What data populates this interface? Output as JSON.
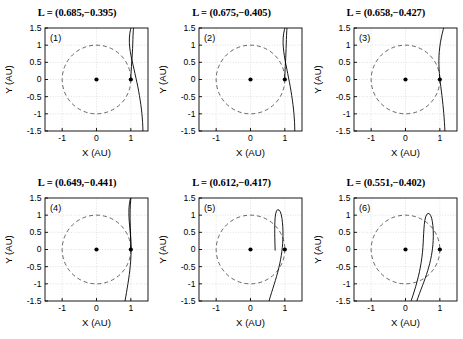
{
  "figure": {
    "rows": 2,
    "cols": 3,
    "background": "#ffffff",
    "curve_color": "#000000",
    "circle_color": "#555555",
    "grid_color": "#cccccc",
    "axis_color": "#000000"
  },
  "axes": {
    "xlabel": "X (AU)",
    "ylabel": "Y (AU)",
    "xticks": [
      "-1",
      "0",
      "1"
    ],
    "xtick_values": [
      -1,
      0,
      1
    ],
    "yticks": [
      "1.5",
      "1",
      "0.5",
      "0",
      "-0.5",
      "-1",
      "-1.5"
    ],
    "ytick_values": [
      1.5,
      1,
      0.5,
      0,
      -0.5,
      -1,
      -1.5
    ],
    "xlim": [
      -1.5,
      1.5
    ],
    "ylim": [
      -1.5,
      1.5
    ],
    "grid": true,
    "grid_style": "dotted"
  },
  "markers": {
    "origin": {
      "x": 0,
      "y": 0,
      "label": "sun-marker"
    },
    "earth": {
      "x": 1,
      "y": 0,
      "label": "earth-marker"
    },
    "unit_circle_radius": 1,
    "unit_circle_style": "dashed"
  },
  "chart_data": {
    "type": "line",
    "xlabel": "X (AU)",
    "ylabel": "Y (AU)",
    "xlim": [
      -1.5,
      1.5
    ],
    "ylim": [
      -1.5,
      1.5
    ],
    "grid": true,
    "legend": "none",
    "panels": [
      {
        "index": "(1)",
        "title": "L = (0.685,−0.395)",
        "L": [
          0.685,
          -0.395
        ],
        "curve": [
          [
            1.352,
            -1.5
          ],
          [
            1.349,
            -1.38
          ],
          [
            1.343,
            -1.25
          ],
          [
            1.334,
            -1.12
          ],
          [
            1.322,
            -0.99
          ],
          [
            1.308,
            -0.86
          ],
          [
            1.291,
            -0.73
          ],
          [
            1.272,
            -0.6
          ],
          [
            1.251,
            -0.47
          ],
          [
            1.228,
            -0.34
          ],
          [
            1.203,
            -0.21
          ],
          [
            1.176,
            -0.08
          ],
          [
            1.15,
            0.04
          ],
          [
            1.121,
            0.17
          ],
          [
            1.092,
            0.3
          ],
          [
            1.062,
            0.43
          ],
          [
            1.033,
            0.56
          ],
          [
            1.006,
            0.69
          ],
          [
            0.983,
            0.82
          ],
          [
            0.966,
            0.95
          ],
          [
            0.957,
            1.08
          ],
          [
            0.958,
            1.21
          ],
          [
            0.97,
            1.34
          ],
          [
            0.992,
            1.46
          ],
          [
            1.002,
            1.5
          ]
        ],
        "curve2": [
          [
            1.0,
            0.0
          ],
          [
            1.004,
            0.12
          ],
          [
            1.01,
            0.25
          ],
          [
            1.018,
            0.38
          ],
          [
            1.027,
            0.51
          ],
          [
            1.036,
            0.64
          ],
          [
            1.044,
            0.77
          ],
          [
            1.051,
            0.9
          ],
          [
            1.056,
            1.03
          ],
          [
            1.06,
            1.16
          ],
          [
            1.065,
            1.29
          ],
          [
            1.072,
            1.42
          ],
          [
            1.078,
            1.5
          ]
        ]
      },
      {
        "index": "(2)",
        "title": "L = (0.675,−0.405)",
        "L": [
          0.675,
          -0.405
        ],
        "curve": [
          [
            1.29,
            -1.5
          ],
          [
            1.288,
            -1.38
          ],
          [
            1.283,
            -1.25
          ],
          [
            1.275,
            -1.12
          ],
          [
            1.265,
            -0.99
          ],
          [
            1.252,
            -0.86
          ],
          [
            1.237,
            -0.73
          ],
          [
            1.22,
            -0.6
          ],
          [
            1.201,
            -0.47
          ],
          [
            1.18,
            -0.34
          ],
          [
            1.158,
            -0.21
          ],
          [
            1.134,
            -0.08
          ],
          [
            1.11,
            0.04
          ],
          [
            1.085,
            0.17
          ],
          [
            1.059,
            0.3
          ],
          [
            1.033,
            0.43
          ],
          [
            1.008,
            0.56
          ],
          [
            0.986,
            0.69
          ],
          [
            0.968,
            0.82
          ],
          [
            0.955,
            0.95
          ],
          [
            0.949,
            1.08
          ],
          [
            0.952,
            1.21
          ],
          [
            0.965,
            1.34
          ],
          [
            0.988,
            1.45
          ],
          [
            1.0,
            1.5
          ]
        ],
        "curve2": [
          [
            1.0,
            0.0
          ],
          [
            1.002,
            0.12
          ],
          [
            1.006,
            0.25
          ],
          [
            1.012,
            0.38
          ],
          [
            1.019,
            0.51
          ],
          [
            1.026,
            0.64
          ],
          [
            1.032,
            0.77
          ],
          [
            1.037,
            0.9
          ],
          [
            1.041,
            1.03
          ],
          [
            1.045,
            1.16
          ],
          [
            1.05,
            1.29
          ],
          [
            1.057,
            1.42
          ],
          [
            1.062,
            1.5
          ]
        ]
      },
      {
        "index": "(3)",
        "title": "L = (0.658,−0.427)",
        "L": [
          0.658,
          -0.427
        ],
        "curve": [
          [
            1.148,
            -1.5
          ],
          [
            1.142,
            -1.38
          ],
          [
            1.134,
            -1.25
          ],
          [
            1.125,
            -1.12
          ],
          [
            1.115,
            -0.99
          ],
          [
            1.103,
            -0.86
          ],
          [
            1.09,
            -0.73
          ],
          [
            1.076,
            -0.6
          ],
          [
            1.061,
            -0.47
          ],
          [
            1.045,
            -0.34
          ],
          [
            1.029,
            -0.21
          ],
          [
            1.013,
            -0.08
          ],
          [
            0.999,
            0.04
          ],
          [
            0.987,
            0.17
          ],
          [
            0.978,
            0.3
          ],
          [
            0.973,
            0.43
          ],
          [
            0.972,
            0.56
          ],
          [
            0.976,
            0.69
          ],
          [
            0.985,
            0.82
          ],
          [
            0.999,
            0.95
          ],
          [
            1.018,
            1.08
          ],
          [
            1.042,
            1.21
          ],
          [
            1.07,
            1.34
          ],
          [
            1.1,
            1.46
          ],
          [
            1.112,
            1.5
          ]
        ],
        "curve2": []
      },
      {
        "index": "(4)",
        "title": "L = (0.649,−0.441)",
        "L": [
          0.649,
          -0.441
        ],
        "curve": [
          [
            0.83,
            -1.5
          ],
          [
            0.852,
            -1.38
          ],
          [
            0.874,
            -1.25
          ],
          [
            0.896,
            -1.12
          ],
          [
            0.917,
            -0.99
          ],
          [
            0.937,
            -0.86
          ],
          [
            0.955,
            -0.73
          ],
          [
            0.971,
            -0.6
          ],
          [
            0.984,
            -0.47
          ],
          [
            0.995,
            -0.34
          ],
          [
            1.002,
            -0.21
          ],
          [
            1.006,
            -0.08
          ],
          [
            1.006,
            0.04
          ],
          [
            1.003,
            0.17
          ],
          [
            0.997,
            0.3
          ],
          [
            0.988,
            0.43
          ],
          [
            0.977,
            0.56
          ],
          [
            0.965,
            0.69
          ],
          [
            0.954,
            0.82
          ],
          [
            0.946,
            0.95
          ],
          [
            0.943,
            1.08
          ],
          [
            0.947,
            1.21
          ],
          [
            0.96,
            1.34
          ],
          [
            0.982,
            1.46
          ],
          [
            0.994,
            1.5
          ]
        ],
        "curve2": [
          [
            1.0,
            0.0
          ],
          [
            0.999,
            0.12
          ],
          [
            0.997,
            0.25
          ],
          [
            0.994,
            0.38
          ],
          [
            0.99,
            0.51
          ],
          [
            0.986,
            0.64
          ],
          [
            0.982,
            0.77
          ],
          [
            0.979,
            0.9
          ],
          [
            0.978,
            1.03
          ],
          [
            0.98,
            1.16
          ],
          [
            0.985,
            1.29
          ],
          [
            0.995,
            1.42
          ],
          [
            1.002,
            1.5
          ]
        ]
      },
      {
        "index": "(5)",
        "title": "L = (0.612,−0.417)",
        "L": [
          0.612,
          -0.417
        ],
        "curve": [
          [
            0.54,
            -1.5
          ],
          [
            0.575,
            -1.38
          ],
          [
            0.612,
            -1.26
          ],
          [
            0.65,
            -1.14
          ],
          [
            0.688,
            -1.02
          ],
          [
            0.725,
            -0.9
          ],
          [
            0.76,
            -0.78
          ],
          [
            0.793,
            -0.66
          ],
          [
            0.823,
            -0.54
          ],
          [
            0.851,
            -0.42
          ],
          [
            0.875,
            -0.3
          ],
          [
            0.896,
            -0.18
          ],
          [
            0.913,
            -0.06
          ],
          [
            0.927,
            0.06
          ],
          [
            0.937,
            0.18
          ],
          [
            0.943,
            0.3
          ],
          [
            0.946,
            0.42
          ],
          [
            0.945,
            0.54
          ],
          [
            0.94,
            0.66
          ],
          [
            0.931,
            0.78
          ],
          [
            0.917,
            0.9
          ],
          [
            0.897,
            1.01
          ],
          [
            0.868,
            1.1
          ],
          [
            0.83,
            1.15
          ],
          [
            0.79,
            1.16
          ],
          [
            0.756,
            1.12
          ],
          [
            0.733,
            1.04
          ],
          [
            0.719,
            0.94
          ],
          [
            0.711,
            0.82
          ],
          [
            0.707,
            0.7
          ],
          [
            0.706,
            0.58
          ],
          [
            0.706,
            0.46
          ],
          [
            0.708,
            0.34
          ],
          [
            0.711,
            0.22
          ],
          [
            0.714,
            0.1
          ],
          [
            0.718,
            -0.02
          ]
        ],
        "curve2": []
      },
      {
        "index": "(6)",
        "title": "L = (0.551,−0.402)",
        "L": [
          0.551,
          -0.402
        ],
        "curve": [
          [
            0.33,
            -1.5
          ],
          [
            0.368,
            -1.39
          ],
          [
            0.408,
            -1.28
          ],
          [
            0.45,
            -1.17
          ],
          [
            0.492,
            -1.06
          ],
          [
            0.533,
            -0.95
          ],
          [
            0.573,
            -0.84
          ],
          [
            0.611,
            -0.73
          ],
          [
            0.646,
            -0.62
          ],
          [
            0.678,
            -0.51
          ],
          [
            0.707,
            -0.4
          ],
          [
            0.733,
            -0.29
          ],
          [
            0.755,
            -0.18
          ],
          [
            0.773,
            -0.07
          ],
          [
            0.788,
            0.04
          ],
          [
            0.799,
            0.15
          ],
          [
            0.806,
            0.26
          ],
          [
            0.81,
            0.37
          ],
          [
            0.81,
            0.48
          ],
          [
            0.806,
            0.59
          ],
          [
            0.797,
            0.7
          ],
          [
            0.783,
            0.81
          ],
          [
            0.762,
            0.91
          ],
          [
            0.733,
            0.99
          ],
          [
            0.697,
            1.04
          ],
          [
            0.657,
            1.05
          ],
          [
            0.618,
            1.02
          ],
          [
            0.587,
            0.95
          ],
          [
            0.564,
            0.85
          ],
          [
            0.548,
            0.73
          ],
          [
            0.537,
            0.6
          ],
          [
            0.529,
            0.47
          ],
          [
            0.522,
            0.33
          ],
          [
            0.515,
            0.19
          ],
          [
            0.506,
            0.05
          ],
          [
            0.494,
            -0.09
          ],
          [
            0.478,
            -0.23
          ],
          [
            0.458,
            -0.37
          ],
          [
            0.434,
            -0.51
          ],
          [
            0.406,
            -0.65
          ],
          [
            0.374,
            -0.79
          ],
          [
            0.338,
            -0.93
          ],
          [
            0.299,
            -1.07
          ],
          [
            0.257,
            -1.21
          ],
          [
            0.213,
            -1.35
          ],
          [
            0.168,
            -1.48
          ],
          [
            0.163,
            -1.5
          ]
        ],
        "curve2": []
      }
    ]
  }
}
